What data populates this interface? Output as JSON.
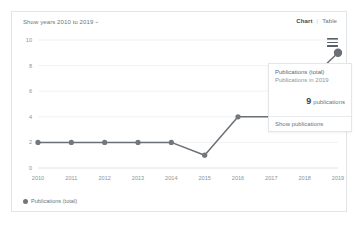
{
  "header": {
    "year_range_label": "Show years 2010 to 2019",
    "chevron_glyph": "⌄",
    "chart_tab_label": "Chart",
    "separator": "|",
    "table_tab_label": "Table"
  },
  "menu": {
    "icon_name": "hamburger-menu-icon"
  },
  "legend": {
    "label": "Publications (total)"
  },
  "tooltip": {
    "title": "Publications (total)",
    "subtitle": "Publications in 2019",
    "count": "9",
    "count_label": "publications",
    "action_label": "Show publications"
  },
  "colors": {
    "line": "#6b7076",
    "marker": "#72777d",
    "grid": "#edeff1",
    "axis": "#d8dbde",
    "text": "#6b757e",
    "muted_text": "#8b949c",
    "card_border": "#e2e5e8",
    "background": "#ffffff"
  },
  "chart_data": {
    "type": "line",
    "title": "",
    "xlabel": "",
    "ylabel": "",
    "categories": [
      "2010",
      "2011",
      "2012",
      "2013",
      "2014",
      "2015",
      "2016",
      "2017",
      "2018",
      "2019"
    ],
    "series": [
      {
        "name": "Publications (total)",
        "values": [
          2,
          2,
          2,
          2,
          2,
          1,
          4,
          4,
          null,
          9
        ]
      }
    ],
    "ylim": [
      0,
      10
    ],
    "yticks": [
      0,
      2,
      4,
      6,
      8,
      10
    ],
    "grid": true,
    "legend_position": "bottom-left",
    "highlighted_point": {
      "x": "2019",
      "y": 9
    },
    "annotations": [
      {
        "text": "9 publications",
        "target": "2019"
      }
    ]
  }
}
